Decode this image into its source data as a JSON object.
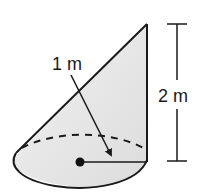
{
  "figure": {
    "shape": "oblique cone",
    "labels": {
      "slant_label": "1 m",
      "height_label": "2 m"
    },
    "colors": {
      "fill": "#e6e6e6",
      "stroke": "#1a1a1a",
      "background": "#ffffff"
    }
  }
}
